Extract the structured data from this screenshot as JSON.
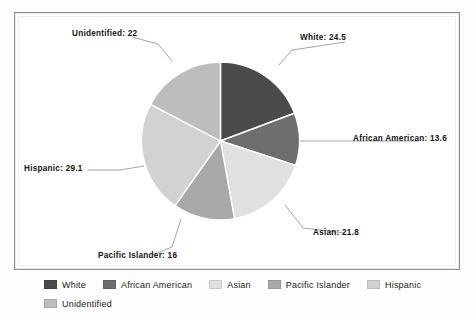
{
  "chart_data": {
    "type": "pie",
    "title": "",
    "categories": [
      "White",
      "African American",
      "Asian",
      "Pacific Islander",
      "Hispanic",
      "Unidentified"
    ],
    "values": [
      24.5,
      13.6,
      21.8,
      16,
      29.1,
      22
    ],
    "labels": [
      "White: 24.5",
      "African American: 13.6",
      "Asian: 21.8",
      "Pacific Islander: 16",
      "Hispanic: 29.1",
      "Unidentified: 22"
    ],
    "colors": [
      "#4a4a4a",
      "#6e6e6e",
      "#e0e0e0",
      "#a8a8a8",
      "#d2d2d2",
      "#bdbdbd"
    ],
    "start_angle_deg": 0,
    "direction": "clockwise",
    "legend_position": "bottom",
    "grid": false
  },
  "slices": [
    {
      "name": "White",
      "label": "White: 24.5",
      "value": 24.5,
      "color": "#4a4a4a"
    },
    {
      "name": "African American",
      "label": "African American: 13.6",
      "value": 13.6,
      "color": "#6e6e6e"
    },
    {
      "name": "Asian",
      "label": "Asian: 21.8",
      "value": 21.8,
      "color": "#e0e0e0"
    },
    {
      "name": "Pacific Islander",
      "label": "Pacific Islander: 16",
      "value": 16,
      "color": "#a8a8a8"
    },
    {
      "name": "Hispanic",
      "label": "Hispanic: 29.1",
      "value": 29.1,
      "color": "#d2d2d2"
    },
    {
      "name": "Unidentified",
      "label": "Unidentified: 22",
      "value": 22,
      "color": "#bdbdbd"
    }
  ],
  "legend": {
    "items": [
      {
        "label": "White",
        "color": "#4a4a4a"
      },
      {
        "label": "African American",
        "color": "#6e6e6e"
      },
      {
        "label": "Asian",
        "color": "#e0e0e0"
      },
      {
        "label": "Pacific Islander",
        "color": "#a8a8a8"
      },
      {
        "label": "Hispanic",
        "color": "#d2d2d2"
      },
      {
        "label": "Unidentified",
        "color": "#bdbdbd"
      }
    ]
  },
  "style": {
    "plot_background": "#ffffff",
    "frame_color": "#8c8c92",
    "label_color": "#131313",
    "leader_line_color": "#9a9a9a"
  }
}
